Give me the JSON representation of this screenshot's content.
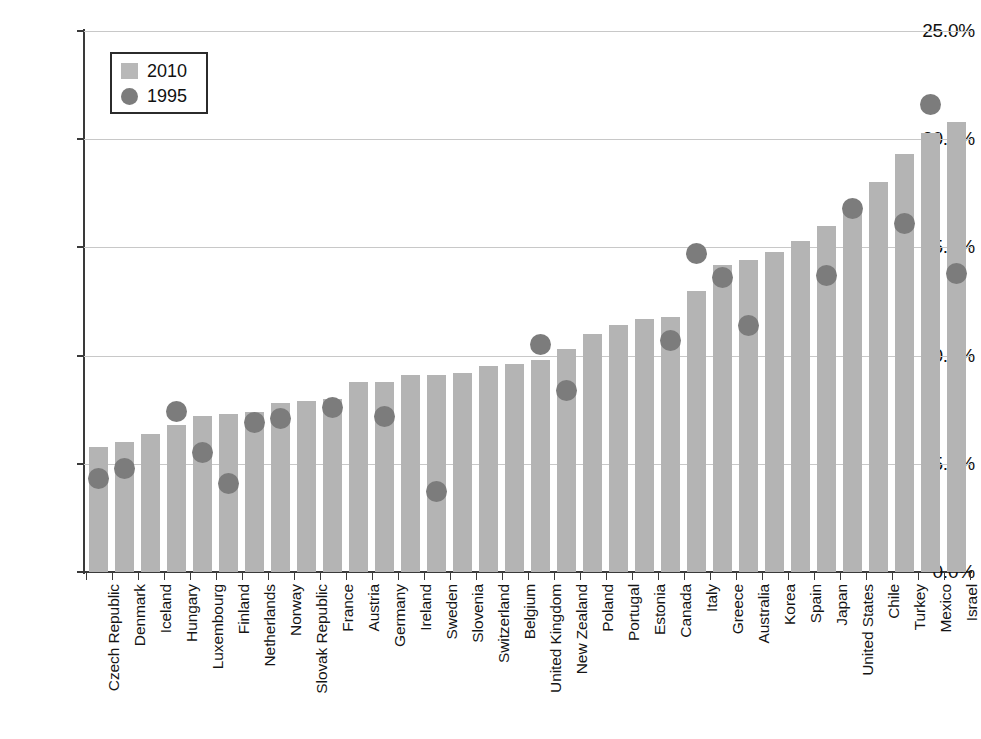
{
  "chart_data": {
    "type": "bar",
    "title": "",
    "subtitle": "",
    "xlabel": "",
    "ylabel": "",
    "ylim": [
      0,
      25
    ],
    "ytick_labels": [
      "0.0%",
      "5.0%",
      "10.0%",
      "15.0%",
      "20.0%",
      "25.0%"
    ],
    "ytick_values": [
      0,
      5,
      10,
      15,
      20,
      25
    ],
    "grid": true,
    "legend_position": "upper-left",
    "legend": [
      {
        "label": "2010",
        "marker": "bar",
        "color": "#b4b4b4"
      },
      {
        "label": "1995",
        "marker": "circle",
        "color": "#7c7c7c"
      }
    ],
    "categories": [
      "Czech Republic",
      "Denmark",
      "Iceland",
      "Hungary",
      "Luxembourg",
      "Finland",
      "Netherlands",
      "Norway",
      "Slovak Republic",
      "France",
      "Austria",
      "Germany",
      "Ireland",
      "Sweden",
      "Slovenia",
      "Switzerland",
      "Belgium",
      "United Kingdom",
      "New Zealand",
      "Poland",
      "Portugal",
      "Estonia",
      "Canada",
      "Italy",
      "Greece",
      "Australia",
      "Korea",
      "Spain",
      "Japan",
      "United States",
      "Chile",
      "Turkey",
      "Mexico",
      "Israel"
    ],
    "series": [
      {
        "name": "2010",
        "type": "bar",
        "color": "#b4b4b4",
        "values": [
          5.8,
          6.0,
          6.4,
          6.8,
          7.2,
          7.3,
          7.4,
          7.8,
          7.9,
          8.0,
          8.8,
          8.8,
          9.1,
          9.1,
          9.2,
          9.5,
          9.6,
          9.8,
          10.3,
          11.0,
          11.4,
          11.7,
          11.8,
          13.0,
          14.2,
          14.4,
          14.8,
          15.3,
          16.0,
          16.9,
          18.0,
          19.3,
          20.3,
          20.8
        ]
      },
      {
        "name": "1995",
        "type": "scatter",
        "color": "#7c7c7c",
        "values": [
          4.3,
          4.8,
          null,
          7.4,
          5.5,
          4.1,
          6.9,
          7.1,
          null,
          7.6,
          null,
          7.2,
          null,
          3.7,
          null,
          null,
          null,
          10.5,
          8.4,
          null,
          null,
          null,
          10.7,
          14.7,
          13.6,
          11.4,
          null,
          null,
          13.7,
          16.8,
          null,
          16.1,
          21.6,
          13.8
        ]
      }
    ]
  }
}
